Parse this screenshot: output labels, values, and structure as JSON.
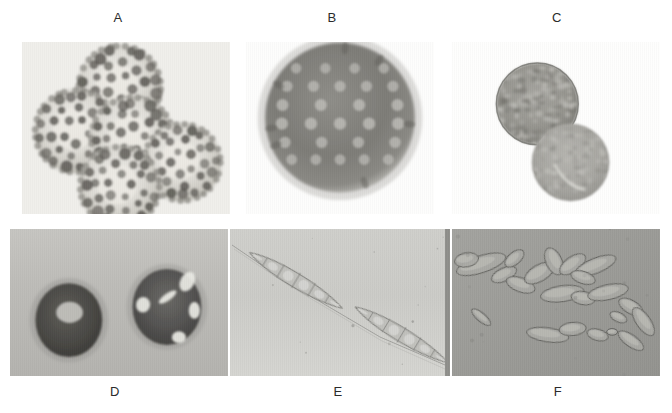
{
  "figure": {
    "width": 672,
    "height": 413,
    "background": "#ffffff",
    "kind": "light-microscopy-plate",
    "panel_count": 6
  },
  "panels": [
    {
      "label": "A",
      "label_x": 118,
      "label_y": 10,
      "x": 22,
      "y": 42,
      "width": 208,
      "height": 172,
      "background": "#f1f0ec",
      "content": "cluster of five spherical ornamented spores with warty spiny surface",
      "object_count": 5,
      "object_shape": "sphere",
      "surface": "echinulate-warty",
      "objects": [
        {
          "cx": 0.47,
          "cy": 0.26,
          "r": 0.155,
          "warts": 30
        },
        {
          "cx": 0.26,
          "cy": 0.52,
          "r": 0.155,
          "warts": 30
        },
        {
          "cx": 0.53,
          "cy": 0.56,
          "r": 0.155,
          "warts": 30
        },
        {
          "cx": 0.77,
          "cy": 0.7,
          "r": 0.145,
          "warts": 28
        },
        {
          "cx": 0.47,
          "cy": 0.84,
          "r": 0.15,
          "warts": 29
        }
      ]
    },
    {
      "label": "B",
      "label_x": 332,
      "label_y": 10,
      "x": 246,
      "y": 42,
      "width": 188,
      "height": 172,
      "background": "#ffffff",
      "content": "single dark spherical spore with pale circular pits arranged in rows",
      "object_count": 1,
      "object_shape": "sphere",
      "surface": "pitted-foveolate",
      "objects": [
        {
          "cx": 0.5,
          "cy": 0.44,
          "r": 0.3,
          "pits": 22
        }
      ]
    },
    {
      "label": "C",
      "label_x": 557,
      "label_y": 10,
      "x": 452,
      "y": 42,
      "width": 208,
      "height": 172,
      "background": "#ffffff",
      "content": "two spherical spores, upper granular-reticulate, lower smoother with curved germ slit",
      "object_count": 2,
      "object_shape": "sphere",
      "surface": "granular",
      "objects": [
        {
          "cx": 0.41,
          "cy": 0.36,
          "r": 0.195,
          "type": "granular"
        },
        {
          "cx": 0.57,
          "cy": 0.7,
          "r": 0.185,
          "type": "slit"
        }
      ]
    },
    {
      "label": "D",
      "label_x": 115,
      "label_y": 384,
      "x": 10,
      "y": 229,
      "width": 218,
      "height": 147,
      "background": "#bcbcb8",
      "content": "two dark spheroidal spores, left with pale central vacuole, right with bright refractile appendages",
      "object_count": 2,
      "object_shape": "spheroid",
      "surface": "smooth-dark",
      "objects": [
        {
          "cx": 0.27,
          "cy": 0.62,
          "r": 0.165,
          "type": "vacuolate"
        },
        {
          "cx": 0.72,
          "cy": 0.53,
          "r": 0.165,
          "type": "appendaged"
        }
      ]
    },
    {
      "label": "E",
      "label_x": 338,
      "label_y": 384,
      "x": 230,
      "y": 229,
      "width": 220,
      "height": 147,
      "background": "#c8c8c4",
      "content": "two elongate fusiform multicellular conidia with tapering filamentous appendages running diagonally",
      "object_count": 2,
      "object_shape": "fusiform-septate",
      "surface": "hyaline",
      "objects": [
        {
          "cx": 0.3,
          "cy": 0.35,
          "len": 0.34,
          "cells": 6
        },
        {
          "cx": 0.78,
          "cy": 0.72,
          "len": 0.34,
          "cells": 6
        }
      ]
    },
    {
      "label": "F",
      "label_x": 558,
      "label_y": 384,
      "x": 452,
      "y": 229,
      "width": 208,
      "height": 147,
      "background": "#9e9e9a",
      "content": "numerous scattered ellipsoidal to ovoid hyaline cells of varying size",
      "object_count": 22,
      "object_shape": "ellipsoid",
      "surface": "smooth-hyaline",
      "objects": [
        {
          "cx": 0.14,
          "cy": 0.24,
          "rx": 0.085,
          "ry": 0.036,
          "rot": -18
        },
        {
          "cx": 0.07,
          "cy": 0.21,
          "rx": 0.04,
          "ry": 0.03,
          "rot": -10
        },
        {
          "cx": 0.25,
          "cy": 0.31,
          "rx": 0.045,
          "ry": 0.028,
          "rot": -25
        },
        {
          "cx": 0.33,
          "cy": 0.38,
          "rx": 0.05,
          "ry": 0.03,
          "rot": 20
        },
        {
          "cx": 0.42,
          "cy": 0.3,
          "rx": 0.055,
          "ry": 0.035,
          "rot": -30
        },
        {
          "cx": 0.49,
          "cy": 0.22,
          "rx": 0.048,
          "ry": 0.034,
          "rot": 65
        },
        {
          "cx": 0.58,
          "cy": 0.24,
          "rx": 0.05,
          "ry": 0.032,
          "rot": -35
        },
        {
          "cx": 0.69,
          "cy": 0.25,
          "rx": 0.072,
          "ry": 0.032,
          "rot": -22
        },
        {
          "cx": 0.53,
          "cy": 0.44,
          "rx": 0.072,
          "ry": 0.034,
          "rot": -8
        },
        {
          "cx": 0.63,
          "cy": 0.47,
          "rx": 0.04,
          "ry": 0.028,
          "rot": 10
        },
        {
          "cx": 0.75,
          "cy": 0.43,
          "rx": 0.068,
          "ry": 0.032,
          "rot": -12
        },
        {
          "cx": 0.86,
          "cy": 0.53,
          "rx": 0.045,
          "ry": 0.028,
          "rot": 30
        },
        {
          "cx": 0.92,
          "cy": 0.63,
          "rx": 0.055,
          "ry": 0.03,
          "rot": 55
        },
        {
          "cx": 0.14,
          "cy": 0.6,
          "rx": 0.04,
          "ry": 0.018,
          "rot": 40
        },
        {
          "cx": 0.46,
          "cy": 0.72,
          "rx": 0.07,
          "ry": 0.03,
          "rot": 8
        },
        {
          "cx": 0.58,
          "cy": 0.68,
          "rx": 0.045,
          "ry": 0.028,
          "rot": -5
        },
        {
          "cx": 0.7,
          "cy": 0.72,
          "rx": 0.036,
          "ry": 0.024,
          "rot": 15
        },
        {
          "cx": 0.77,
          "cy": 0.7,
          "rx": 0.018,
          "ry": 0.014,
          "rot": 0
        },
        {
          "cx": 0.86,
          "cy": 0.76,
          "rx": 0.05,
          "ry": 0.025,
          "rot": 35
        },
        {
          "cx": 0.3,
          "cy": 0.2,
          "rx": 0.038,
          "ry": 0.026,
          "rot": -40
        },
        {
          "cx": 0.63,
          "cy": 0.33,
          "rx": 0.042,
          "ry": 0.026,
          "rot": 18
        },
        {
          "cx": 0.8,
          "cy": 0.6,
          "rx": 0.03,
          "ry": 0.02,
          "rot": 25
        }
      ]
    }
  ]
}
